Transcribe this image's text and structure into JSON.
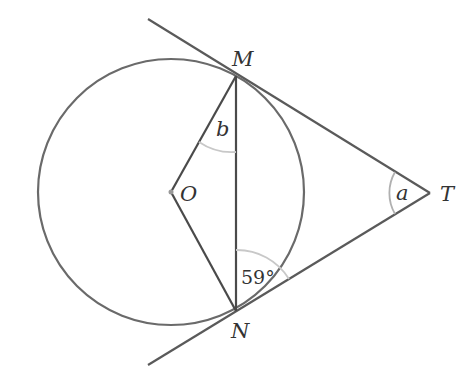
{
  "diagram": {
    "points": {
      "O": {
        "label": "O",
        "x": 171,
        "y": 192
      },
      "M": {
        "label": "M",
        "x": 236,
        "y": 76
      },
      "N": {
        "label": "N",
        "x": 236,
        "y": 311
      },
      "T": {
        "label": "T",
        "x": 430,
        "y": 193
      }
    },
    "circle": {
      "center": "O",
      "radius": 133
    },
    "angles": {
      "b": {
        "label": "b",
        "at": "M",
        "between": [
          "MO",
          "MN"
        ]
      },
      "a": {
        "label": "a",
        "at": "T",
        "between": [
          "TM",
          "TN"
        ]
      },
      "given": {
        "label": "59°",
        "at": "N",
        "between": [
          "NM",
          "NT"
        ]
      }
    },
    "colors": {
      "line": "#5a5a5a",
      "arc": "#c8c8c8",
      "text": "#333333"
    }
  }
}
